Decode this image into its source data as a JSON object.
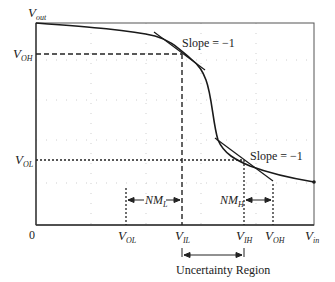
{
  "diagram": {
    "axes": {
      "y_label": {
        "main": "V",
        "sub": "out"
      },
      "x_label": {
        "main": "V",
        "sub": "in"
      },
      "origin_label": "0"
    },
    "y_ticks": [
      {
        "main": "V",
        "sub": "OH"
      },
      {
        "main": "V",
        "sub": "OL"
      }
    ],
    "x_ticks": [
      {
        "main": "V",
        "sub": "OL"
      },
      {
        "main": "V",
        "sub": "IL"
      },
      {
        "main": "V",
        "sub": "IH"
      },
      {
        "main": "V",
        "sub": "OH"
      }
    ],
    "annotations": {
      "slope_top": "Slope = −1",
      "slope_bottom": "Slope = −1",
      "nm_low": {
        "main": "NM",
        "sub": "L"
      },
      "nm_high": {
        "main": "NM",
        "sub": "H"
      },
      "uncertainty": "Uncertainty Region"
    },
    "colors": {
      "curve": "#1a1a1a",
      "axis": "#333333",
      "grid": "#c8c8c8"
    }
  }
}
